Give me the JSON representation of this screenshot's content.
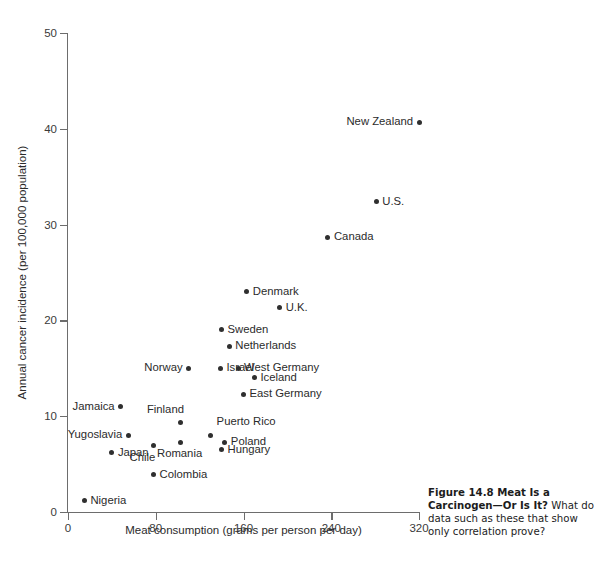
{
  "figure": {
    "caption_bold": "Figure 14.8   Meat Is a Carcinogen—Or Is It?",
    "caption_rest": " What do data such as these that show only correlation prove?"
  },
  "chart_data": {
    "type": "scatter",
    "title": "",
    "xlabel": "Meat consumption (grams per person per day)",
    "ylabel": "Annual cancer incidence (per 100,000 population)",
    "xlim": [
      0,
      320
    ],
    "ylim": [
      0,
      50
    ],
    "xticks": [
      0,
      80,
      160,
      240,
      320
    ],
    "yticks": [
      0,
      10,
      20,
      30,
      40,
      50
    ],
    "grid": false,
    "legend": "none",
    "points": [
      {
        "label": "New Zealand",
        "x": 320,
        "y": 40.7,
        "label_side": "left"
      },
      {
        "label": "U.S.",
        "x": 281,
        "y": 32.4,
        "label_side": "right"
      },
      {
        "label": "Canada",
        "x": 237,
        "y": 28.7,
        "label_side": "right"
      },
      {
        "label": "Denmark",
        "x": 163,
        "y": 23.0,
        "label_side": "right"
      },
      {
        "label": "U.K.",
        "x": 193,
        "y": 21.3,
        "label_side": "right"
      },
      {
        "label": "Sweden",
        "x": 140,
        "y": 19.0,
        "label_side": "right"
      },
      {
        "label": "Netherlands",
        "x": 147,
        "y": 17.3,
        "label_side": "right"
      },
      {
        "label": "Israel",
        "x": 139,
        "y": 15.0,
        "label_side": "right"
      },
      {
        "label": "Norway",
        "x": 110,
        "y": 15.0,
        "label_side": "left"
      },
      {
        "label": "West Germany",
        "x": 155,
        "y": 15.0,
        "label_side": "right"
      },
      {
        "label": "Iceland",
        "x": 170,
        "y": 14.0,
        "label_side": "right"
      },
      {
        "label": "East Germany",
        "x": 160,
        "y": 12.3,
        "label_side": "right"
      },
      {
        "label": "Jamaica",
        "x": 48,
        "y": 11.0,
        "label_side": "left"
      },
      {
        "label": "Finland",
        "x": 103,
        "y": 9.3,
        "label_side": "topleft"
      },
      {
        "label": "Yugoslavia",
        "x": 55,
        "y": 8.0,
        "label_side": "left"
      },
      {
        "label": "Puerto Rico",
        "x": 130,
        "y": 8.0,
        "label_side": "topright"
      },
      {
        "label": "Poland",
        "x": 143,
        "y": 7.3,
        "label_side": "right"
      },
      {
        "label": "Romania",
        "x": 103,
        "y": 7.3,
        "label_side": "below"
      },
      {
        "label": "Chile",
        "x": 78,
        "y": 6.9,
        "label_side": "below"
      },
      {
        "label": "Hungary",
        "x": 140,
        "y": 6.5,
        "label_side": "right"
      },
      {
        "label": "Japan",
        "x": 40,
        "y": 6.2,
        "label_side": "right"
      },
      {
        "label": "Colombia",
        "x": 78,
        "y": 3.9,
        "label_side": "right"
      },
      {
        "label": "Nigeria",
        "x": 15,
        "y": 1.2,
        "label_side": "right"
      }
    ]
  }
}
